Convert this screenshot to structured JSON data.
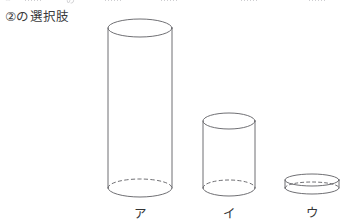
{
  "page": {
    "width": 352,
    "height": 222,
    "background": "#ffffff",
    "ink_color": "#5f5f63",
    "text_color": "#343436"
  },
  "cut_off_row": {
    "description": "faint partially-cropped line of text from the row above",
    "fragments": [
      "①",
      "……",
      "の",
      "……",
      "……",
      "……",
      "……"
    ]
  },
  "heading": {
    "text": "②の選択肢"
  },
  "figure": {
    "caption": "three cylinders of equal diameter and decreasing height",
    "stroke_color": "#5f5f63",
    "stroke_width": 0.9,
    "hidden_edge_style": "dashed",
    "shapes": [
      {
        "name": "tall-cylinder",
        "label": "ア",
        "cx": 140,
        "rx": 32,
        "ry": 9,
        "top_y": 28,
        "bottom_y": 188,
        "height_px": 160,
        "label_x": 140,
        "label_y": 203
      },
      {
        "name": "medium-cylinder",
        "label": "イ",
        "cx": 229,
        "rx": 26,
        "ry": 8,
        "top_y": 121,
        "bottom_y": 188,
        "height_px": 67,
        "label_x": 229,
        "label_y": 203
      },
      {
        "name": "flat-disk",
        "label": "ウ",
        "cx": 312,
        "rx": 27,
        "ry": 6,
        "top_y": 180,
        "bottom_y": 188,
        "height_px": 8,
        "label_x": 312,
        "label_y": 202
      }
    ]
  },
  "labels": {
    "a": "ア",
    "i": "イ",
    "u": "ウ"
  }
}
